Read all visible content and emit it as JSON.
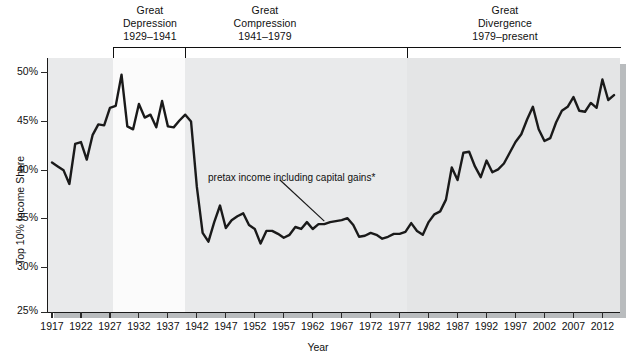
{
  "chart_data": {
    "type": "line",
    "title": "",
    "xlabel": "Year",
    "ylabel": "Top 10% Income Share",
    "xlim": [
      1917,
      2014
    ],
    "ylim": [
      25,
      51
    ],
    "ytick_labels": [
      "50%",
      "45%",
      "40%",
      "35%",
      "30%",
      "25%"
    ],
    "ytick_values": [
      50,
      45,
      40,
      35,
      30,
      25
    ],
    "xtick_labels": [
      "1917",
      "1922",
      "1927",
      "1932",
      "1937",
      "1942",
      "1947",
      "1952",
      "1957",
      "1962",
      "1967",
      "1972",
      "1977",
      "1982",
      "1987",
      "1992",
      "1997",
      "2002",
      "2007",
      "2012"
    ],
    "xtick_values": [
      1917,
      1922,
      1927,
      1932,
      1937,
      1942,
      1947,
      1952,
      1957,
      1962,
      1967,
      1972,
      1977,
      1982,
      1987,
      1992,
      1997,
      2002,
      2007,
      2012
    ],
    "grid": false,
    "legend_position": "none",
    "series": [
      {
        "name": "pretax income including capital gains*",
        "color": "#1a1a1a",
        "x": [
          1917,
          1918,
          1919,
          1920,
          1921,
          1922,
          1923,
          1924,
          1925,
          1926,
          1927,
          1928,
          1929,
          1930,
          1931,
          1932,
          1933,
          1934,
          1935,
          1936,
          1937,
          1938,
          1939,
          1940,
          1941,
          1942,
          1943,
          1944,
          1945,
          1946,
          1947,
          1948,
          1949,
          1950,
          1951,
          1952,
          1953,
          1954,
          1955,
          1956,
          1957,
          1958,
          1959,
          1960,
          1961,
          1962,
          1963,
          1964,
          1965,
          1966,
          1967,
          1968,
          1969,
          1970,
          1971,
          1972,
          1973,
          1974,
          1975,
          1976,
          1977,
          1978,
          1979,
          1980,
          1981,
          1982,
          1983,
          1984,
          1985,
          1986,
          1987,
          1988,
          1989,
          1990,
          1991,
          1992,
          1993,
          1994,
          1995,
          1996,
          1997,
          1998,
          1999,
          2000,
          2001,
          2002,
          2003,
          2004,
          2005,
          2006,
          2007,
          2008,
          2009,
          2010,
          2011,
          2012,
          2013,
          2014
        ],
        "y": [
          40.3,
          39.9,
          39.5,
          38.1,
          42.2,
          42.4,
          40.6,
          43.1,
          44.2,
          44.1,
          45.9,
          46.1,
          49.3,
          44.0,
          43.7,
          46.3,
          44.9,
          45.2,
          43.9,
          46.6,
          44.0,
          43.9,
          44.6,
          45.2,
          44.5,
          37.8,
          33.1,
          32.2,
          34.2,
          35.9,
          33.6,
          34.4,
          34.8,
          35.1,
          33.9,
          33.5,
          32.0,
          33.3,
          33.3,
          33.0,
          32.6,
          32.9,
          33.7,
          33.5,
          34.2,
          33.5,
          34.0,
          34.0,
          34.2,
          34.3,
          34.4,
          34.6,
          33.9,
          32.7,
          32.8,
          33.1,
          32.9,
          32.5,
          32.7,
          33.0,
          33.0,
          33.2,
          34.1,
          33.3,
          32.9,
          34.2,
          35.0,
          35.3,
          36.5,
          39.8,
          38.5,
          41.3,
          41.4,
          39.9,
          38.8,
          40.5,
          39.3,
          39.6,
          40.2,
          41.3,
          42.4,
          43.2,
          44.7,
          46.0,
          43.7,
          42.5,
          42.8,
          44.4,
          45.6,
          46.0,
          47.0,
          45.6,
          45.5,
          46.4,
          45.9,
          48.8,
          46.7,
          47.2
        ]
      }
    ],
    "annotation": {
      "text": "pretax income including capital gains*",
      "target_year": 1964,
      "target_value": 34.0
    },
    "eras": [
      {
        "title_line1": "Great",
        "title_line2": "Depression",
        "range": "1929–1941",
        "start": 1929,
        "end": 1941
      },
      {
        "title_line1": "Great",
        "title_line2": "Compression",
        "range": "1941–1979",
        "start": 1941,
        "end": 1979
      },
      {
        "title_line1": "Great",
        "title_line2": "Divergence",
        "range": "1979–present",
        "start": 1979,
        "end": 2014
      }
    ],
    "colors": {
      "plot_background": "#e9eaeb",
      "band_highlight": "#fbfbfb",
      "band_late": "#e4e5e6",
      "line": "#1a1a1a",
      "axis": "#1a1a1a",
      "shadow": "#b9bcbe"
    }
  }
}
